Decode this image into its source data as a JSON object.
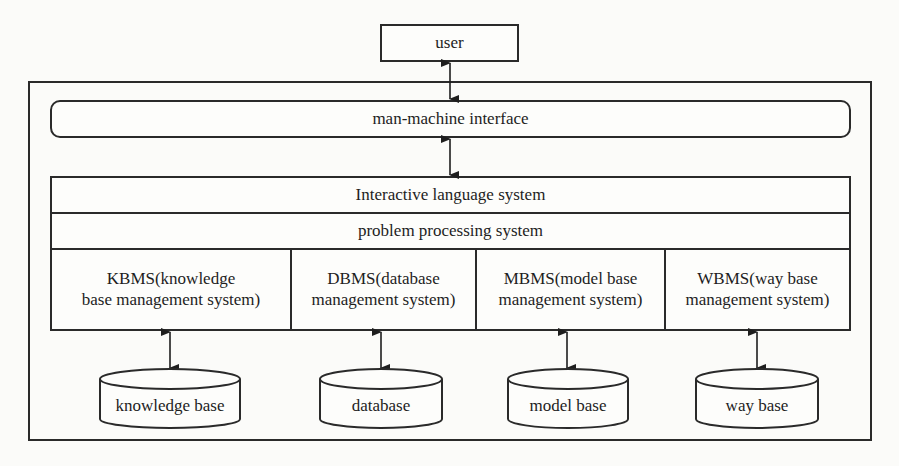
{
  "diagram": {
    "type": "architecture-diagram",
    "user": {
      "label": "user"
    },
    "interface": {
      "label": "man-machine interface"
    },
    "layers": [
      {
        "label": "Interactive language system"
      },
      {
        "label": "problem processing system"
      }
    ],
    "modules": [
      {
        "line1": "KBMS(knowledge",
        "line2": "base management system)"
      },
      {
        "line1": "DBMS(database",
        "line2": "management system)"
      },
      {
        "line1": "MBMS(model base",
        "line2": "management system)"
      },
      {
        "line1": "WBMS(way base",
        "line2": "management system)"
      }
    ],
    "stores": [
      {
        "label": "knowledge base"
      },
      {
        "label": "database"
      },
      {
        "label": "model base"
      },
      {
        "label": "way base"
      }
    ],
    "connections": [
      {
        "from": "user",
        "to": "man-machine interface",
        "type": "bidirectional"
      },
      {
        "from": "man-machine interface",
        "to": "Interactive language system",
        "type": "bidirectional"
      },
      {
        "from": "KBMS",
        "to": "knowledge base",
        "type": "bidirectional"
      },
      {
        "from": "DBMS",
        "to": "database",
        "type": "bidirectional"
      },
      {
        "from": "MBMS",
        "to": "model base",
        "type": "bidirectional"
      },
      {
        "from": "WBMS",
        "to": "way base",
        "type": "bidirectional"
      }
    ]
  }
}
